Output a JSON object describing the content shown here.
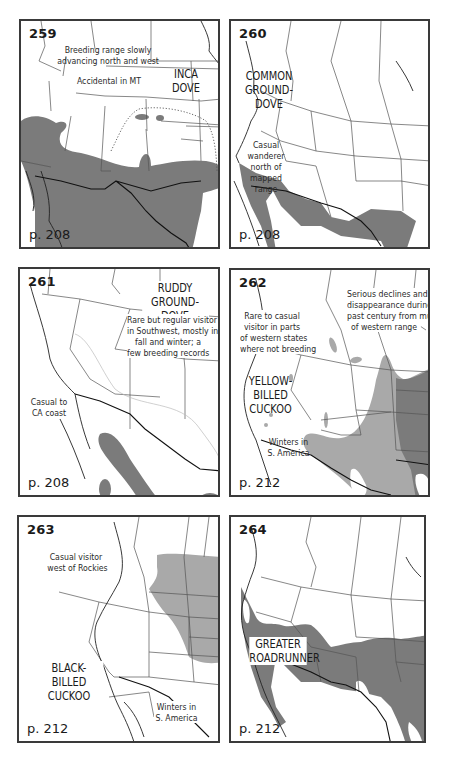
{
  "maps": [
    {
      "number": "259",
      "species": [
        "INCA",
        "DOVE"
      ],
      "page": "p. 208",
      "notes": [
        [
          "Breeding range slowly",
          "advancing north and west"
        ],
        [
          "Accidental in MT"
        ]
      ]
    },
    {
      "number": "260",
      "species": [
        "COMMON",
        "GROUND-DOVE"
      ],
      "page": "p. 208",
      "notes": [
        [
          "Casual",
          "wanderer",
          "north of",
          "mapped",
          "range"
        ]
      ]
    },
    {
      "number": "261",
      "species": [
        "RUDDY",
        "GROUND-DOVE"
      ],
      "page": "p. 208",
      "notes": [
        [
          "Rare but regular visitor",
          "in Southwest, mostly in",
          "fall and winter; a",
          "few breeding records"
        ],
        [
          "Casual to",
          "CA coast"
        ]
      ]
    },
    {
      "number": "262",
      "species": [
        "YELLOW-",
        "BILLED",
        "CUCKOO"
      ],
      "page": "p. 212",
      "notes": [
        [
          "Serious declines and",
          "disappearance during",
          "past century from much",
          "of western range"
        ],
        [
          "Rare to casual",
          "visitor in parts",
          "of western states",
          "where not breeding"
        ],
        [
          "Winters in",
          "S. America"
        ]
      ]
    },
    {
      "number": "263",
      "species": [
        "BLACK-BILLED",
        "CUCKOO"
      ],
      "page": "p. 212",
      "notes": [
        [
          "Casual visitor",
          "west of Rockies"
        ],
        [
          "Winters in",
          "S. America"
        ]
      ]
    },
    {
      "number": "264",
      "species": [
        "GREATER",
        "ROADRUNNER"
      ],
      "page": "p. 212",
      "notes": []
    }
  ],
  "legend_colors": {
    "year_round_or_breeding": "#7b7b7b",
    "breeding_light": "#a9a9a9",
    "frame": "#3a3a3a"
  }
}
